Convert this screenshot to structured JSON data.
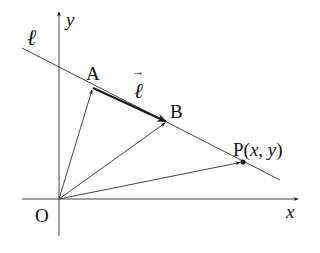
{
  "diagram": {
    "labels": {
      "line": "ℓ",
      "y_axis": "y",
      "x_axis": "x",
      "origin": "O",
      "point_a": "A",
      "point_b": "B",
      "vector": "ℓ",
      "vector_arrow": "→",
      "point_p_name": "P(",
      "point_p_x": "x",
      "point_p_comma": ", ",
      "point_p_y": "y",
      "point_p_close": ")"
    },
    "points": {
      "O": [
        59,
        199
      ],
      "A": [
        93,
        88
      ],
      "B": [
        167,
        122
      ],
      "P": [
        243,
        162
      ]
    },
    "colors": {
      "ink": "#1a1a1a",
      "line": "#444444"
    }
  }
}
